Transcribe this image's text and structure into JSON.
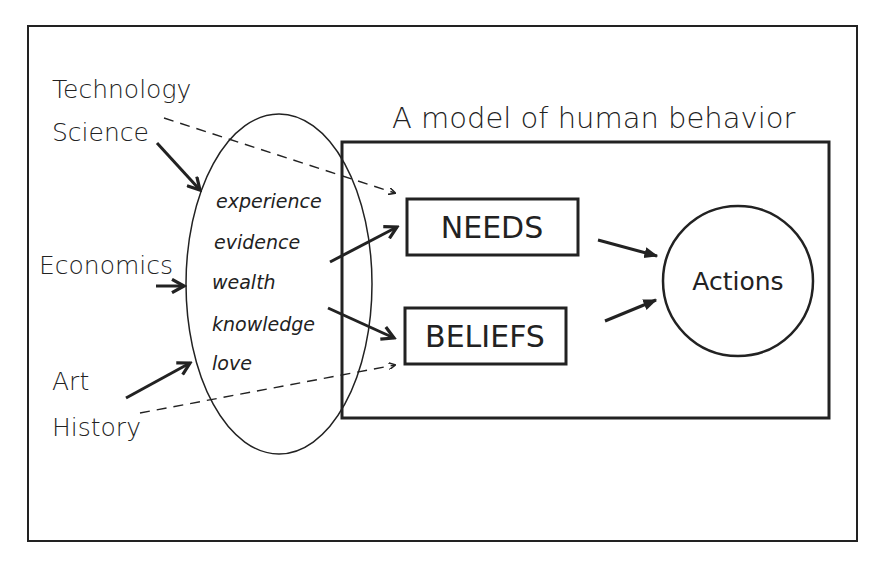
{
  "diagram": {
    "title": "A model of human behavior",
    "external_sources": [
      "Technology",
      "Science",
      "Economics",
      "Art",
      "History"
    ],
    "mediators": [
      "experience",
      "evidence",
      "wealth",
      "knowledge",
      "love"
    ],
    "model_nodes": {
      "needs": "NEEDS",
      "beliefs": "BELIEFS",
      "actions": "Actions"
    },
    "edges": [
      {
        "from": "Technology",
        "to": "NEEDS",
        "style": "dashed"
      },
      {
        "from": "Science",
        "to": "mediators",
        "style": "solid"
      },
      {
        "from": "Economics",
        "to": "mediators",
        "style": "solid"
      },
      {
        "from": "Art",
        "to": "mediators",
        "style": "solid"
      },
      {
        "from": "History",
        "to": "BELIEFS",
        "style": "dashed"
      },
      {
        "from": "mediators",
        "to": "NEEDS",
        "style": "solid"
      },
      {
        "from": "mediators",
        "to": "BELIEFS",
        "style": "solid"
      },
      {
        "from": "NEEDS",
        "to": "Actions",
        "style": "solid"
      },
      {
        "from": "BELIEFS",
        "to": "Actions",
        "style": "solid"
      }
    ],
    "colors": {
      "stroke": "#222222",
      "background": "#ffffff"
    }
  }
}
